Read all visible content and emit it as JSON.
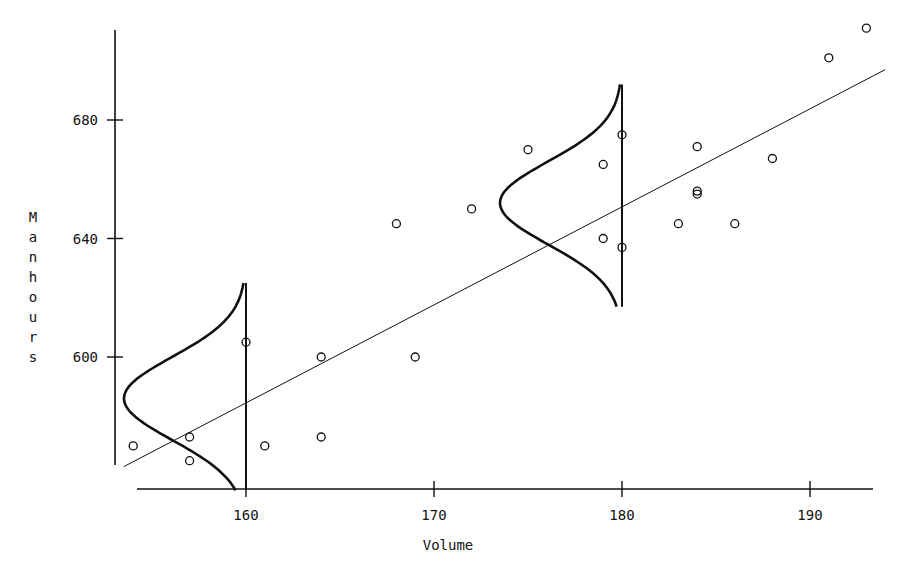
{
  "chart_data": {
    "type": "scatter",
    "title": "",
    "xlabel": "Volume",
    "ylabel": "Manhours",
    "x_ticks": [
      160,
      170,
      180,
      190
    ],
    "y_ticks": [
      600,
      640,
      680
    ],
    "xlim": [
      153.5,
      194
    ],
    "ylim": [
      561,
      714
    ],
    "grid": false,
    "legend": null,
    "points": [
      {
        "x": 154,
        "y": 570
      },
      {
        "x": 157,
        "y": 573
      },
      {
        "x": 157,
        "y": 565
      },
      {
        "x": 160,
        "y": 605
      },
      {
        "x": 161,
        "y": 570
      },
      {
        "x": 164,
        "y": 600
      },
      {
        "x": 164,
        "y": 573
      },
      {
        "x": 168,
        "y": 645
      },
      {
        "x": 169,
        "y": 600
      },
      {
        "x": 172,
        "y": 650
      },
      {
        "x": 175,
        "y": 670
      },
      {
        "x": 179,
        "y": 665
      },
      {
        "x": 179,
        "y": 640
      },
      {
        "x": 180,
        "y": 675
      },
      {
        "x": 180,
        "y": 637
      },
      {
        "x": 183,
        "y": 645
      },
      {
        "x": 184,
        "y": 671
      },
      {
        "x": 184,
        "y": 656
      },
      {
        "x": 184,
        "y": 655
      },
      {
        "x": 186,
        "y": 645
      },
      {
        "x": 188,
        "y": 667
      },
      {
        "x": 191,
        "y": 701
      },
      {
        "x": 193,
        "y": 711
      }
    ],
    "regression_line": {
      "x0": 153.5,
      "y0": 563,
      "x1": 194,
      "y1": 697
    },
    "normal_curves": [
      {
        "x_center": 160,
        "mean": 586,
        "sd": 14,
        "y_from": 555,
        "y_to": 625
      },
      {
        "x_center": 180,
        "mean": 652,
        "sd": 14,
        "y_from": 617,
        "y_to": 692
      }
    ]
  }
}
